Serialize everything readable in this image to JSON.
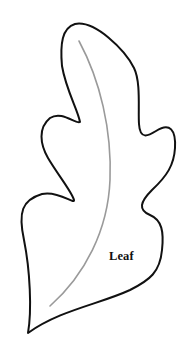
{
  "figure": {
    "label": "Leaf",
    "outline_color": "#111111",
    "midrib_color": "#9a9a9a",
    "background": "#ffffff"
  }
}
